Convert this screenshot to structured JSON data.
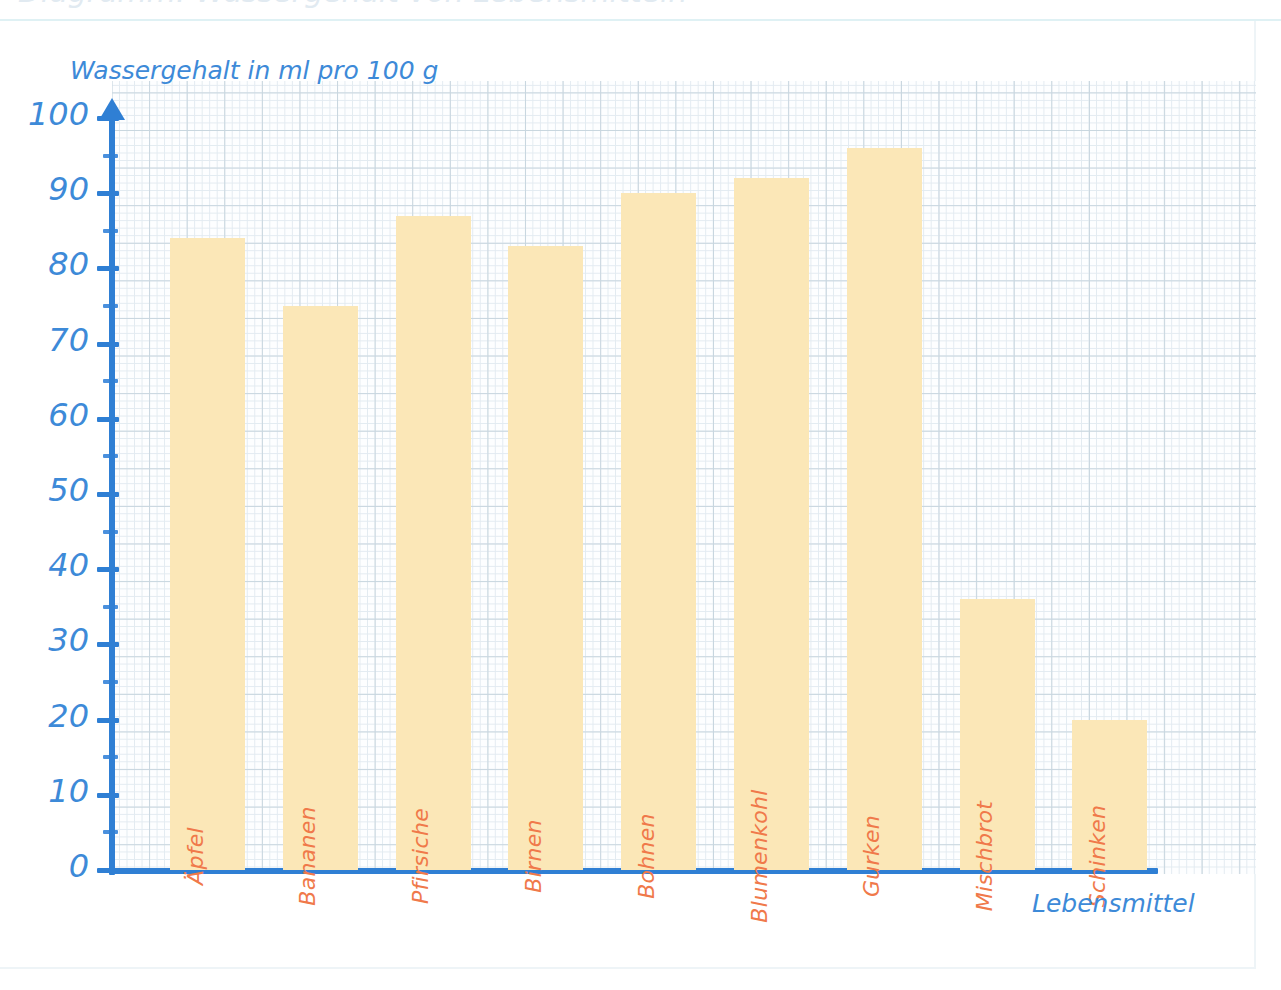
{
  "page": {
    "title_cut_off": "Diagramm: Wassergehalt von Lebensmitteln"
  },
  "colors": {
    "axis": "#2f7fd4",
    "axis_text": "#3d8ad8",
    "bar_fill": "#fbe7b7",
    "bar_label": "#f0794a",
    "grid_major": "#c3d2dc",
    "grid_minor": "#e0e9f0",
    "paper": "#fdfeff"
  },
  "chart_data": {
    "type": "bar",
    "title": "",
    "xlabel": "Lebensmittel",
    "ylabel": "Wassergehalt in ml pro 100 g",
    "categories": [
      "Äpfel",
      "Bananen",
      "Pfirsiche",
      "Birnen",
      "Bohnen",
      "Blumenkohl",
      "Gurken",
      "Mischbrot",
      "Schinken"
    ],
    "values": [
      84,
      75,
      87,
      83,
      90,
      92,
      96,
      36,
      20
    ],
    "ylim": [
      0,
      100
    ],
    "ytick_labels": [
      "0",
      "10",
      "20",
      "30",
      "40",
      "50",
      "60",
      "70",
      "80",
      "90",
      "100"
    ],
    "ytick_values": [
      0,
      10,
      20,
      30,
      40,
      50,
      60,
      70,
      80,
      90,
      100
    ],
    "yminor_values": [
      5,
      15,
      25,
      35,
      45,
      55,
      65,
      75,
      85,
      95
    ],
    "grid": true,
    "legend": "none",
    "unit": "ml pro 100 g"
  }
}
